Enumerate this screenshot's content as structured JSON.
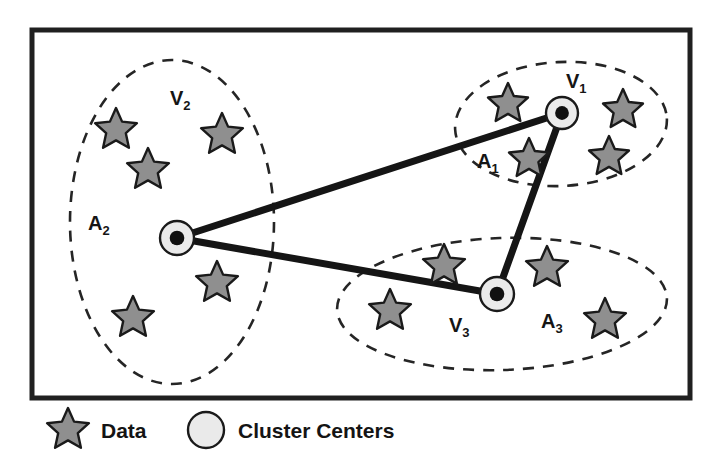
{
  "figure": {
    "background_color": "#ffffff",
    "border_color": "#202020",
    "star_fill": "#8f8f8f",
    "star_stroke": "#1a1a1a",
    "center_fill": "#eaeaea",
    "center_stroke": "#1a1a1a",
    "center_dot_color": "#101010",
    "ellipse_stroke": "#252525",
    "connector_color": "#151515"
  },
  "frame": {
    "x": 32,
    "y": 30,
    "width": 658,
    "height": 368
  },
  "clusters": [
    {
      "id": "cluster-1",
      "region_label": "V",
      "region_sub": "1",
      "set_label": "A",
      "set_sub": "1",
      "region_label_x": 566,
      "region_label_y": 88,
      "set_label_x": 477,
      "set_label_y": 168,
      "ellipse": {
        "cx": 561,
        "cy": 124,
        "rx": 106,
        "ry": 62,
        "rotate": -3
      },
      "center": {
        "x": 562,
        "y": 113,
        "r": 16
      },
      "stars": [
        {
          "x": 508,
          "y": 104,
          "r": 21
        },
        {
          "x": 623,
          "y": 110,
          "r": 21
        },
        {
          "x": 529,
          "y": 159,
          "r": 21
        },
        {
          "x": 609,
          "y": 157,
          "r": 21
        }
      ]
    },
    {
      "id": "cluster-2",
      "region_label": "V",
      "region_sub": "2",
      "set_label": "A",
      "set_sub": "2",
      "region_label_x": 170,
      "region_label_y": 105,
      "set_label_x": 88,
      "set_label_y": 230,
      "ellipse": {
        "cx": 172,
        "cy": 222,
        "rx": 102,
        "ry": 162,
        "rotate": 0
      },
      "center": {
        "x": 177,
        "y": 238,
        "r": 17
      },
      "stars": [
        {
          "x": 116,
          "y": 130,
          "r": 22
        },
        {
          "x": 222,
          "y": 135,
          "r": 22
        },
        {
          "x": 148,
          "y": 170,
          "r": 22
        },
        {
          "x": 217,
          "y": 283,
          "r": 22
        },
        {
          "x": 133,
          "y": 318,
          "r": 22
        }
      ]
    },
    {
      "id": "cluster-3",
      "region_label": "V",
      "region_sub": "3",
      "set_label": "A",
      "set_sub": "3",
      "region_label_x": 449,
      "region_label_y": 332,
      "set_label_x": 541,
      "set_label_y": 328,
      "ellipse": {
        "cx": 502,
        "cy": 304,
        "rx": 165,
        "ry": 66,
        "rotate": -2
      },
      "center": {
        "x": 497,
        "y": 294,
        "r": 17
      },
      "stars": [
        {
          "x": 444,
          "y": 266,
          "r": 22
        },
        {
          "x": 547,
          "y": 268,
          "r": 22
        },
        {
          "x": 390,
          "y": 311,
          "r": 22
        },
        {
          "x": 605,
          "y": 320,
          "r": 22
        }
      ]
    }
  ],
  "connectors": [
    {
      "from": "cluster-2",
      "to": "cluster-1",
      "x1": 177,
      "y1": 238,
      "x2": 562,
      "y2": 113
    },
    {
      "from": "cluster-2",
      "to": "cluster-3",
      "x1": 177,
      "y1": 238,
      "x2": 497,
      "y2": 294
    },
    {
      "from": "cluster-1",
      "to": "cluster-3",
      "x1": 562,
      "y1": 113,
      "x2": 497,
      "y2": 294
    }
  ],
  "legend": {
    "items": [
      {
        "symbol": "star",
        "label": "Data",
        "symbol_x": 68,
        "symbol_y": 430,
        "symbol_r": 22,
        "label_x": 101,
        "label_y": 438
      },
      {
        "symbol": "circle",
        "label": "Cluster Centers",
        "symbol_x": 206,
        "symbol_y": 430,
        "symbol_r": 18,
        "label_x": 238,
        "label_y": 438
      }
    ]
  }
}
